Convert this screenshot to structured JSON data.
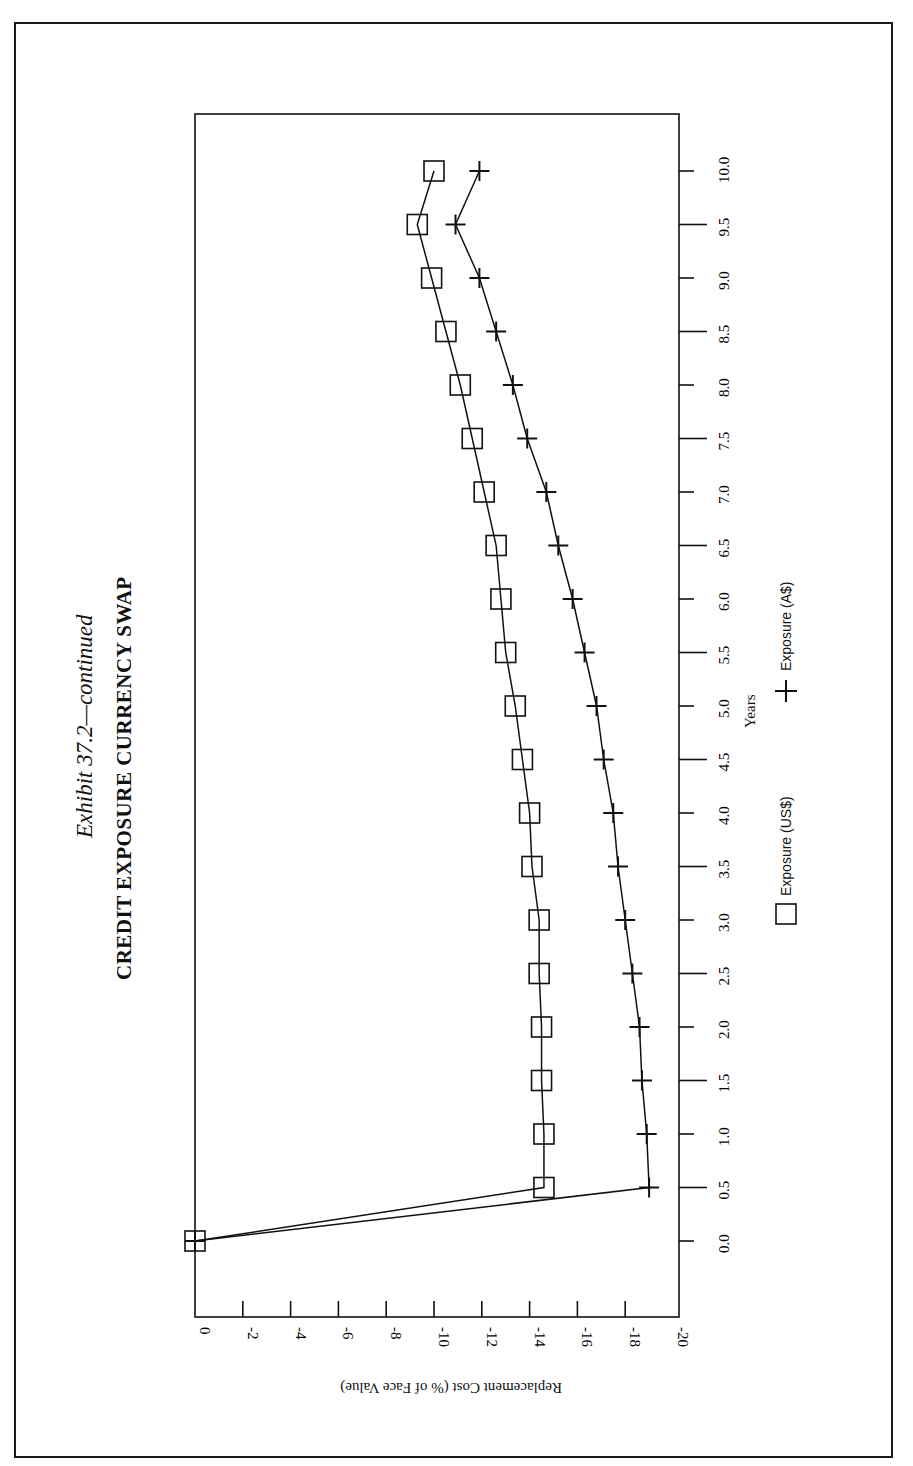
{
  "page": {
    "page_number": "1025"
  },
  "title": {
    "exhibit": "Exhibit 37.2—continued",
    "heading": "CREDIT EXPOSURE CURRENCY SWAP"
  },
  "axes": {
    "x_label": "Years",
    "y_label": "Replacement Cost (% of Face Value)",
    "x_ticks": [
      "0.0",
      "0.5",
      "1.0",
      "1.5",
      "2.0",
      "2.5",
      "3.0",
      "3.5",
      "4.0",
      "4.5",
      "5.0",
      "5.5",
      "6.0",
      "6.5",
      "7.0",
      "7.5",
      "8.0",
      "8.5",
      "9.0",
      "9.5",
      "10.0"
    ],
    "y_ticks": [
      "0",
      "-2",
      "-4",
      "-6",
      "-8",
      "-10",
      "-12",
      "-14",
      "-16",
      "-18",
      "-20"
    ]
  },
  "legend": {
    "items": [
      {
        "label": "Exposure (US$)",
        "marker": "square"
      },
      {
        "label": "Exposure (A$)",
        "marker": "plus"
      }
    ]
  },
  "chart_data": {
    "type": "line",
    "xlabel": "Years",
    "ylabel": "Replacement Cost (% of Face Value)",
    "xlim": [
      0,
      10
    ],
    "ylim": [
      -20,
      0
    ],
    "grid": false,
    "legend_position": "bottom",
    "orientation": "page rotated 90° (years run bottom-to-top on the right edge)",
    "x": [
      0.0,
      0.5,
      1.0,
      1.5,
      2.0,
      2.5,
      3.0,
      3.5,
      4.0,
      4.5,
      5.0,
      5.5,
      6.0,
      6.5,
      7.0,
      7.5,
      8.0,
      8.5,
      9.0,
      9.5,
      10.0
    ],
    "series": [
      {
        "name": "Exposure (US$)",
        "marker": "square",
        "values": [
          0,
          -14.6,
          -14.6,
          -14.5,
          -14.5,
          -14.4,
          -14.4,
          -14.1,
          -14.0,
          -13.7,
          -13.4,
          -13.0,
          -12.8,
          -12.6,
          -12.1,
          -11.6,
          -11.1,
          -10.5,
          -9.9,
          -9.3,
          -10.0
        ]
      },
      {
        "name": "Exposure (A$)",
        "marker": "plus",
        "values": [
          0,
          -19.0,
          -18.9,
          -18.7,
          -18.6,
          -18.3,
          -18.0,
          -17.7,
          -17.5,
          -17.1,
          -16.8,
          -16.3,
          -15.8,
          -15.2,
          -14.7,
          -13.9,
          -13.3,
          -12.6,
          -11.9,
          -10.9,
          -11.9
        ]
      }
    ]
  }
}
